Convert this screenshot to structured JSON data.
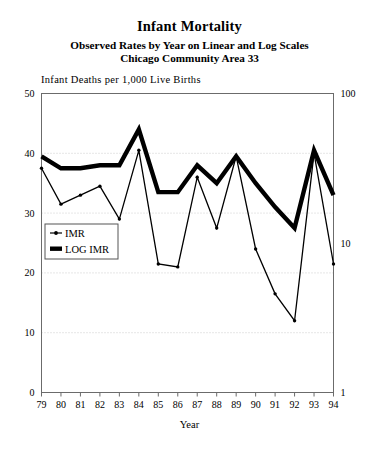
{
  "figure": {
    "title": "Infant Mortality",
    "subtitle_1": "Observed Rates by Year on Linear and Log Scales",
    "subtitle_2": "Chicago Community Area 33"
  },
  "chart_data": {
    "type": "line",
    "title": "Infant Mortality",
    "subtitle": "Observed Rates by Year on Linear and Log Scales / Chicago Community Area 33",
    "xlabel": "Year",
    "ylabel": "Infant Deaths per 1,000 Live Births",
    "grid": true,
    "legend_position": "center-left",
    "x": [
      "79",
      "80",
      "81",
      "82",
      "83",
      "84",
      "85",
      "86",
      "87",
      "88",
      "89",
      "90",
      "91",
      "92",
      "93",
      "94"
    ],
    "categories": [
      "79",
      "80",
      "81",
      "82",
      "83",
      "84",
      "85",
      "86",
      "87",
      "88",
      "89",
      "90",
      "91",
      "92",
      "93",
      "94"
    ],
    "axes": {
      "left": {
        "label": "Infant Deaths per 1,000 Live Births",
        "scale": "linear",
        "ticks": [
          0,
          10,
          20,
          30,
          40,
          50
        ],
        "tick_labels": [
          "0",
          "10",
          "20",
          "30",
          "40",
          "50"
        ],
        "ylim": [
          0,
          50
        ]
      },
      "right": {
        "scale": "log",
        "ticks": [
          1,
          10,
          100
        ],
        "tick_labels": [
          "1",
          "10",
          "100"
        ],
        "ylim": [
          1,
          100
        ]
      },
      "x": {
        "label": "Year",
        "tick_labels": [
          "79",
          "80",
          "81",
          "82",
          "83",
          "84",
          "85",
          "86",
          "87",
          "88",
          "89",
          "90",
          "91",
          "92",
          "93",
          "94"
        ]
      }
    },
    "series": [
      {
        "name": "IMR",
        "style": "thin-line-with-markers",
        "axis": "left-linear",
        "values": [
          37.5,
          31.5,
          33.0,
          34.5,
          29.0,
          40.5,
          21.5,
          21.0,
          36.0,
          27.5,
          39.5,
          24.0,
          16.5,
          12.0,
          40.0,
          21.5
        ]
      },
      {
        "name": "LOG IMR",
        "style": "thick-line",
        "axis": "right-log",
        "values": [
          39.5,
          37.5,
          37.5,
          38.0,
          38.0,
          44.0,
          33.5,
          33.5,
          38.0,
          35.0,
          39.5,
          35.0,
          31.0,
          27.5,
          40.5,
          33.0
        ]
      }
    ],
    "legend": [
      {
        "label": "IMR",
        "marker": "thin-line-dot"
      },
      {
        "label": "LOG IMR",
        "marker": "thick-bar"
      }
    ],
    "colors": {
      "series_imr": "#000000",
      "series_log_imr": "#000000",
      "frame": "#6b6b6b",
      "grid": "#c8c8c8",
      "background": "#ffffff"
    }
  }
}
